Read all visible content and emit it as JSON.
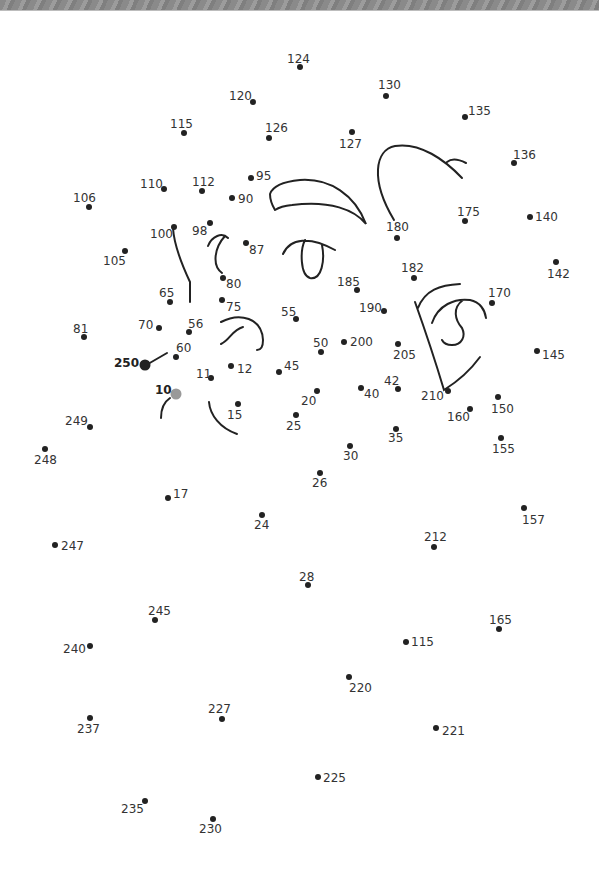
{
  "page": {
    "type": "connect-the-dots worksheet",
    "background": "#ffffff",
    "banner_color": "#8c8c8c"
  },
  "colors": {
    "dot": "#222222",
    "label": "#333333",
    "start_dot": "#999999",
    "line": "#222222"
  },
  "dots": [
    {
      "label": "124",
      "x": 300,
      "y": 67,
      "lx": 287,
      "ly": 63
    },
    {
      "label": "120",
      "x": 253,
      "y": 102,
      "lx": 229,
      "ly": 100
    },
    {
      "label": "130",
      "x": 386,
      "y": 96,
      "lx": 378,
      "ly": 89
    },
    {
      "label": "135",
      "x": 465,
      "y": 117,
      "lx": 468,
      "ly": 115
    },
    {
      "label": "115",
      "x": 184,
      "y": 133,
      "lx": 170,
      "ly": 128
    },
    {
      "label": "126",
      "x": 269,
      "y": 138,
      "lx": 265,
      "ly": 132
    },
    {
      "label": "127",
      "x": 352,
      "y": 132,
      "lx": 339,
      "ly": 148
    },
    {
      "label": "136",
      "x": 514,
      "y": 163,
      "lx": 513,
      "ly": 159
    },
    {
      "label": "110",
      "x": 164,
      "y": 189,
      "lx": 140,
      "ly": 188
    },
    {
      "label": "112",
      "x": 202,
      "y": 191,
      "lx": 192,
      "ly": 186
    },
    {
      "label": "95",
      "x": 251,
      "y": 178,
      "lx": 256,
      "ly": 180
    },
    {
      "label": "90",
      "x": 232,
      "y": 198,
      "lx": 238,
      "ly": 203
    },
    {
      "label": "106",
      "x": 89,
      "y": 207,
      "lx": 73,
      "ly": 202
    },
    {
      "label": "175",
      "x": 465,
      "y": 221,
      "lx": 457,
      "ly": 216
    },
    {
      "label": "140",
      "x": 530,
      "y": 217,
      "lx": 535,
      "ly": 221
    },
    {
      "label": "100",
      "x": 174,
      "y": 227,
      "lx": 150,
      "ly": 238
    },
    {
      "label": "98",
      "x": 210,
      "y": 223,
      "lx": 192,
      "ly": 235
    },
    {
      "label": "180",
      "x": 397,
      "y": 238,
      "lx": 386,
      "ly": 231
    },
    {
      "label": "87",
      "x": 246,
      "y": 243,
      "lx": 249,
      "ly": 254
    },
    {
      "label": "105",
      "x": 125,
      "y": 251,
      "lx": 103,
      "ly": 265
    },
    {
      "label": "142",
      "x": 556,
      "y": 262,
      "lx": 547,
      "ly": 278
    },
    {
      "label": "182",
      "x": 414,
      "y": 278,
      "lx": 401,
      "ly": 272
    },
    {
      "label": "80",
      "x": 223,
      "y": 278,
      "lx": 226,
      "ly": 288
    },
    {
      "label": "185",
      "x": 357,
      "y": 290,
      "lx": 337,
      "ly": 286
    },
    {
      "label": "170",
      "x": 492,
      "y": 303,
      "lx": 488,
      "ly": 297
    },
    {
      "label": "65",
      "x": 170,
      "y": 302,
      "lx": 159,
      "ly": 297
    },
    {
      "label": "75",
      "x": 222,
      "y": 300,
      "lx": 226,
      "ly": 311
    },
    {
      "label": "190",
      "x": 384,
      "y": 311,
      "lx": 359,
      "ly": 312
    },
    {
      "label": "55",
      "x": 296,
      "y": 319,
      "lx": 281,
      "ly": 316
    },
    {
      "label": "81",
      "x": 84,
      "y": 337,
      "lx": 73,
      "ly": 333
    },
    {
      "label": "70",
      "x": 159,
      "y": 328,
      "lx": 138,
      "ly": 329
    },
    {
      "label": "56",
      "x": 189,
      "y": 332,
      "lx": 188,
      "ly": 328
    },
    {
      "label": "50",
      "x": 321,
      "y": 352,
      "lx": 313,
      "ly": 347
    },
    {
      "label": "200",
      "x": 344,
      "y": 342,
      "lx": 350,
      "ly": 346
    },
    {
      "label": "205",
      "x": 398,
      "y": 344,
      "lx": 393,
      "ly": 359
    },
    {
      "label": "145",
      "x": 537,
      "y": 351,
      "lx": 542,
      "ly": 359
    },
    {
      "label": "60",
      "x": 176,
      "y": 357,
      "lx": 176,
      "ly": 352
    },
    {
      "label": "250",
      "x": 145,
      "y": 365,
      "lx": 114,
      "ly": 367,
      "bold": true,
      "big": true
    },
    {
      "label": "12",
      "x": 231,
      "y": 366,
      "lx": 237,
      "ly": 373
    },
    {
      "label": "45",
      "x": 279,
      "y": 372,
      "lx": 284,
      "ly": 370
    },
    {
      "label": "11",
      "x": 211,
      "y": 378,
      "lx": 196,
      "ly": 378
    },
    {
      "label": "42",
      "x": 398,
      "y": 389,
      "lx": 384,
      "ly": 385
    },
    {
      "label": "40",
      "x": 361,
      "y": 388,
      "lx": 364,
      "ly": 398
    },
    {
      "label": "210",
      "x": 448,
      "y": 391,
      "lx": 421,
      "ly": 400
    },
    {
      "label": "20",
      "x": 317,
      "y": 391,
      "lx": 301,
      "ly": 405
    },
    {
      "label": "10",
      "x": 176,
      "y": 394,
      "lx": 155,
      "ly": 394,
      "bold": true,
      "start": true
    },
    {
      "label": "150",
      "x": 498,
      "y": 397,
      "lx": 491,
      "ly": 413
    },
    {
      "label": "160",
      "x": 470,
      "y": 409,
      "lx": 447,
      "ly": 421
    },
    {
      "label": "15",
      "x": 238,
      "y": 404,
      "lx": 227,
      "ly": 419
    },
    {
      "label": "25",
      "x": 296,
      "y": 415,
      "lx": 286,
      "ly": 430
    },
    {
      "label": "249",
      "x": 90,
      "y": 427,
      "lx": 65,
      "ly": 425
    },
    {
      "label": "35",
      "x": 396,
      "y": 429,
      "lx": 388,
      "ly": 442
    },
    {
      "label": "155",
      "x": 501,
      "y": 438,
      "lx": 492,
      "ly": 453
    },
    {
      "label": "30",
      "x": 350,
      "y": 446,
      "lx": 343,
      "ly": 460
    },
    {
      "label": "248",
      "x": 45,
      "y": 449,
      "lx": 34,
      "ly": 464
    },
    {
      "label": "26",
      "x": 320,
      "y": 473,
      "lx": 312,
      "ly": 487
    },
    {
      "label": "17",
      "x": 168,
      "y": 498,
      "lx": 173,
      "ly": 498
    },
    {
      "label": "157",
      "x": 524,
      "y": 508,
      "lx": 522,
      "ly": 524
    },
    {
      "label": "24",
      "x": 262,
      "y": 515,
      "lx": 254,
      "ly": 529
    },
    {
      "label": "212",
      "x": 434,
      "y": 547,
      "lx": 424,
      "ly": 541
    },
    {
      "label": "247",
      "x": 55,
      "y": 545,
      "lx": 61,
      "ly": 550
    },
    {
      "label": "28",
      "x": 308,
      "y": 585,
      "lx": 299,
      "ly": 581
    },
    {
      "label": "245",
      "x": 155,
      "y": 620,
      "lx": 148,
      "ly": 615
    },
    {
      "label": "165",
      "x": 499,
      "y": 629,
      "lx": 489,
      "ly": 624
    },
    {
      "label": "115",
      "x": 406,
      "y": 642,
      "lx": 411,
      "ly": 646
    },
    {
      "label": "240",
      "x": 90,
      "y": 646,
      "lx": 63,
      "ly": 653
    },
    {
      "label": "220",
      "x": 349,
      "y": 677,
      "lx": 349,
      "ly": 692
    },
    {
      "label": "227",
      "x": 222,
      "y": 719,
      "lx": 208,
      "ly": 713
    },
    {
      "label": "237",
      "x": 90,
      "y": 718,
      "lx": 77,
      "ly": 733
    },
    {
      "label": "221",
      "x": 436,
      "y": 728,
      "lx": 442,
      "ly": 735
    },
    {
      "label": "225",
      "x": 318,
      "y": 777,
      "lx": 323,
      "ly": 782
    },
    {
      "label": "235",
      "x": 145,
      "y": 801,
      "lx": 121,
      "ly": 813
    },
    {
      "label": "230",
      "x": 213,
      "y": 819,
      "lx": 199,
      "ly": 833
    }
  ],
  "line_art": [
    {
      "name": "left-eyebrow",
      "d": "M 270 194 C 272 188, 280 182, 300 180 C 330 178, 355 195, 366 224 C 355 210, 330 200, 292 205 C 282 206, 278 208, 275 210 M 270 194 C 270 200, 272 205, 275 210"
    },
    {
      "name": "right-eyebrow",
      "d": "M 394 220 C 370 180, 375 150, 395 146 C 420 142, 445 160, 462 178 M 447 162 C 452 158, 460 160, 466 163"
    },
    {
      "name": "left-eye",
      "d": "M 283 254 C 290 238, 310 236, 335 250 M 305 240 C 300 250, 300 275, 310 278 C 322 280, 325 260, 322 245"
    },
    {
      "name": "right-eye-outer",
      "d": "M 418 308 C 425 290, 440 285, 460 284 M 415 302 C 425 330, 435 360, 444 390 C 460 380, 472 368, 480 357"
    },
    {
      "name": "right-eye-inner",
      "d": "M 432 323 C 438 305, 455 298, 470 300 C 480 302, 485 310, 486 318 M 463 300 C 452 308, 455 320, 462 328 C 466 336, 462 345, 452 345 C 446 345, 443 342, 442 340"
    },
    {
      "name": "nose-line",
      "d": "M 173 228 C 174 245, 182 265, 190 282 L 190 302"
    },
    {
      "name": "ear-curve",
      "d": "M 208 246 C 212 236, 222 232, 228 238 M 225 236 C 214 248, 212 266, 222 273"
    },
    {
      "name": "mouth-curve",
      "d": "M 221 322 C 240 312, 262 318, 263 340 C 263 348, 260 350, 257 350"
    },
    {
      "name": "mouth-inner",
      "d": "M 221 344 C 230 340, 232 330, 243 327"
    },
    {
      "name": "cheek-left",
      "d": "M 148 364 L 167 353"
    },
    {
      "name": "chin-left",
      "d": "M 170 398 C 164 402, 161 410, 161 418"
    },
    {
      "name": "chin-right",
      "d": "M 209 402 C 210 415, 220 428, 237 434"
    }
  ]
}
